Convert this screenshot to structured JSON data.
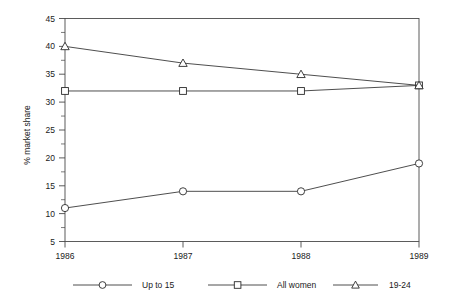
{
  "chart_data": {
    "type": "line",
    "title": "",
    "subtitle": "",
    "xlabel": "",
    "ylabel": "% market share",
    "categories": [
      "1986",
      "1987",
      "1988",
      "1989"
    ],
    "x": [
      1986,
      1987,
      1988,
      1989
    ],
    "ylim": [
      5,
      45
    ],
    "ytick_labels": [
      "5",
      "10",
      "15",
      "20",
      "25",
      "30",
      "35",
      "40",
      "45"
    ],
    "ytick_values": [
      5,
      10,
      15,
      20,
      25,
      30,
      35,
      40,
      45
    ],
    "ytick_step": 5,
    "yminor_step": 2.5,
    "grid": false,
    "legend_position": "bottom",
    "border": "full-frame",
    "series": [
      {
        "name": "Up to 15",
        "marker": "open-circle",
        "values": [
          11,
          14,
          14,
          19
        ]
      },
      {
        "name": "All women",
        "marker": "open-square",
        "values": [
          32,
          32,
          32,
          33
        ]
      },
      {
        "name": "19-24",
        "marker": "open-triangle",
        "values": [
          40,
          37,
          35,
          33
        ]
      }
    ],
    "annotations": []
  },
  "legend": {
    "entries": [
      {
        "label": "Up to 15",
        "marker": "open-circle"
      },
      {
        "label": "All women",
        "marker": "open-square"
      },
      {
        "label": "19-24",
        "marker": "open-triangle"
      }
    ]
  },
  "colors": {
    "line": "#3a3a3a",
    "marker_stroke": "#2a2a2a",
    "marker_fill": "#ffffff",
    "axis": "#4a4a4a",
    "text": "#1a1a1a",
    "background": "#ffffff"
  }
}
